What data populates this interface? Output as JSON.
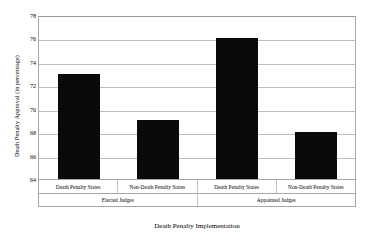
{
  "chart_data": {
    "type": "bar",
    "title": "",
    "xlabel": "Death Penalty Implementation",
    "ylabel": "Death Penalty Approval (in percentage)",
    "categories": [
      "Death Penalty States",
      "Non-Death Penalty States",
      "Death Penalty States",
      "Non-Death Penalty States"
    ],
    "values": [
      73,
      69,
      76,
      68
    ],
    "groups": [
      "Elected Judges",
      "Appointed Judges"
    ],
    "group_spans": [
      2,
      2
    ],
    "ylim": [
      64,
      78
    ],
    "ytick_step": 2,
    "yticks": [
      64,
      66,
      68,
      70,
      72,
      74,
      76,
      78
    ],
    "ytick_labels": [
      "64",
      "66",
      "68",
      "70",
      "72",
      "74",
      "76",
      "78"
    ],
    "grid": true,
    "legend": false,
    "bar_color": "#0a0a0a",
    "gridline_color": "#bdbdbd",
    "axis_color": "#a8a8a8",
    "background_color": "#ffffff"
  }
}
